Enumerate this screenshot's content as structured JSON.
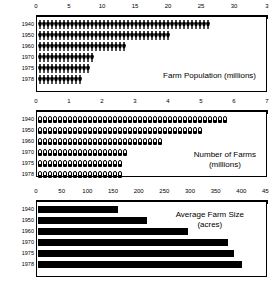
{
  "figure": {
    "panels": [
      {
        "id": "population",
        "caption": "Farm Population (millions)",
        "axis": {
          "position": "top",
          "min": 0,
          "max": 35,
          "ticks": [
            0,
            5,
            10,
            15,
            20,
            25,
            30,
            35
          ],
          "ticklabels": [
            "0",
            "5",
            "10",
            "15",
            "20",
            "25",
            "30",
            "3"
          ]
        },
        "rows": [
          {
            "year": "1940",
            "value": 30.5
          },
          {
            "year": "1950",
            "value": 23.0
          },
          {
            "year": "1960",
            "value": 15.6
          },
          {
            "year": "1970",
            "value": 9.7
          },
          {
            "year": "1975",
            "value": 8.9
          },
          {
            "year": "1978",
            "value": 8.0
          }
        ],
        "glyph": "person-icon",
        "glyph_unit": 0.5
      },
      {
        "id": "farms",
        "caption_line1": "Number of Farms",
        "caption_line2": "(millions)",
        "axis": {
          "position": "top",
          "min": 0,
          "max": 7,
          "ticks": [
            0,
            1,
            2,
            3,
            4,
            5,
            6,
            7
          ],
          "ticklabels": [
            "0",
            "1",
            "2",
            "3",
            "4",
            "5",
            "6",
            "7"
          ]
        },
        "rows": [
          {
            "year": "1940",
            "value": 6.1
          },
          {
            "year": "1950",
            "value": 5.4
          },
          {
            "year": "1960",
            "value": 4.0
          },
          {
            "year": "1970",
            "value": 2.95
          },
          {
            "year": "1975",
            "value": 2.8
          },
          {
            "year": "1978",
            "value": 2.7
          }
        ],
        "glyph": "barn-icon",
        "glyph_unit": 0.145
      },
      {
        "id": "size",
        "caption_line1": "Average Farm Size",
        "caption_line2": "(acres)",
        "axis": {
          "position": "top",
          "min": 0,
          "max": 450,
          "ticks": [
            0,
            50,
            100,
            150,
            200,
            250,
            300,
            350,
            400,
            450
          ],
          "ticklabels": [
            "0",
            "50",
            "100",
            "150",
            "200",
            "250",
            "300",
            "350",
            "400",
            "450"
          ]
        },
        "rows": [
          {
            "year": "1940",
            "value": 157
          },
          {
            "year": "1950",
            "value": 215
          },
          {
            "year": "1960",
            "value": 295
          },
          {
            "year": "1970",
            "value": 374
          },
          {
            "year": "1975",
            "value": 385
          },
          {
            "year": "1978",
            "value": 400
          }
        ],
        "glyph": "solid-bar",
        "glyph_unit": 0
      }
    ]
  },
  "chart_data": [
    {
      "type": "bar",
      "subtype": "pictogram",
      "title": "Farm Population (millions)",
      "xlabel": "millions",
      "ylabel": "",
      "categories": [
        "1940",
        "1950",
        "1960",
        "1970",
        "1975",
        "1978"
      ],
      "values": [
        30.5,
        23.0,
        15.6,
        9.7,
        8.9,
        8.0
      ],
      "xlim": [
        0,
        35
      ],
      "xticks": [
        0,
        5,
        10,
        15,
        20,
        25,
        30,
        35
      ],
      "grid": false,
      "legend": "none",
      "orientation": "horizontal"
    },
    {
      "type": "bar",
      "subtype": "pictogram",
      "title": "Number of Farms (millions)",
      "xlabel": "millions",
      "ylabel": "",
      "categories": [
        "1940",
        "1950",
        "1960",
        "1970",
        "1975",
        "1978"
      ],
      "values": [
        6.1,
        5.4,
        4.0,
        2.95,
        2.8,
        2.7
      ],
      "xlim": [
        0,
        7
      ],
      "xticks": [
        0,
        1,
        2,
        3,
        4,
        5,
        6,
        7
      ],
      "grid": false,
      "legend": "none",
      "orientation": "horizontal"
    },
    {
      "type": "bar",
      "title": "Average Farm Size (acres)",
      "xlabel": "acres",
      "ylabel": "",
      "categories": [
        "1940",
        "1950",
        "1960",
        "1970",
        "1975",
        "1978"
      ],
      "values": [
        157,
        215,
        295,
        374,
        385,
        400
      ],
      "xlim": [
        0,
        450
      ],
      "xticks": [
        0,
        50,
        100,
        150,
        200,
        250,
        300,
        350,
        400,
        450
      ],
      "grid": false,
      "legend": "none",
      "orientation": "horizontal"
    }
  ]
}
